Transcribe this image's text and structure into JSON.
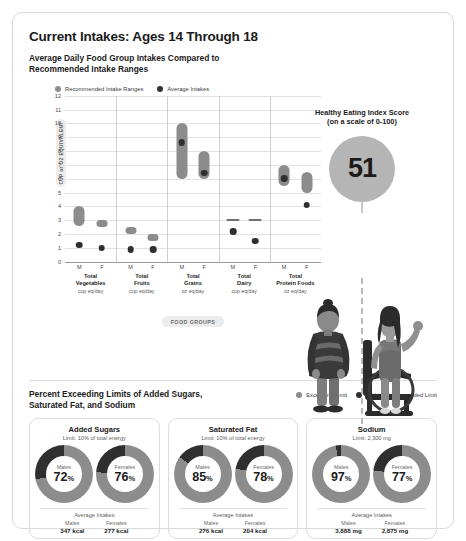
{
  "header": {
    "title": "Current Intakes: Ages 14 Through 18",
    "subtitle_line1": "Average Daily Food Group Intakes Compared to",
    "subtitle_line2": "Recommended Intake Ranges"
  },
  "legend": {
    "range_label": "Recommended Intake Ranges",
    "average_label": "Average Intakes",
    "range_color": "#8c8c8c",
    "average_color": "#333333"
  },
  "hei": {
    "title_line1": "Healthy Eating Index Score",
    "title_line2": "(on a scale of 0-100)",
    "score": "51",
    "circle_color": "#b5b5b5"
  },
  "food_groups_pill": "FOOD GROUPS",
  "chart_data": {
    "type": "bar",
    "title": "Average Daily Food Group Intakes Compared to Recommended Intake Ranges",
    "xlabel": "FOOD GROUPS",
    "ylabel": "CUP or OZ EQUIVALENT",
    "ylim": [
      0,
      12
    ],
    "yticks": [
      0,
      1,
      2,
      3,
      4,
      5,
      6,
      7,
      8,
      9,
      10,
      11,
      12
    ],
    "grid": true,
    "legend_position": "top-left",
    "series": [
      {
        "name": "Recommended Intake Ranges",
        "color": "#8c8c8c"
      },
      {
        "name": "Average Intakes",
        "color": "#333333"
      }
    ],
    "groups": [
      {
        "name": "Total\nVegetables",
        "name_line1": "Total",
        "name_line2": "Vegetables",
        "unit": "cup eq/day",
        "points": [
          {
            "sex": "M",
            "range": [
              2.6,
              4.0
            ],
            "average": 1.2
          },
          {
            "sex": "F",
            "range": [
              2.5,
              3.0
            ],
            "average": 1.0
          }
        ]
      },
      {
        "name": "Total\nFruits",
        "name_line1": "Total",
        "name_line2": "Fruits",
        "unit": "cup eq/day",
        "points": [
          {
            "sex": "M",
            "range": [
              2.0,
              2.5
            ],
            "average": 0.9
          },
          {
            "sex": "F",
            "range": [
              1.5,
              2.0
            ],
            "average": 0.9
          }
        ]
      },
      {
        "name": "Total\nGrains",
        "name_line1": "Total",
        "name_line2": "Grains",
        "unit": "oz eq/day",
        "points": [
          {
            "sex": "M",
            "range": [
              6.0,
              10.0
            ],
            "average": 8.6
          },
          {
            "sex": "F",
            "range": [
              6.0,
              8.0
            ],
            "average": 6.4
          }
        ]
      },
      {
        "name": "Total\nDairy",
        "name_line1": "Total",
        "name_line2": "Dairy",
        "unit": "cup eq/day",
        "points": [
          {
            "sex": "M",
            "range": [
              3.0,
              3.0
            ],
            "average": 2.2
          },
          {
            "sex": "F",
            "range": [
              3.0,
              3.0
            ],
            "average": 1.5
          }
        ]
      },
      {
        "name": "Total\nProtein Foods",
        "name_line1": "Total",
        "name_line2": "Protein Foods",
        "unit": "oz eq/day",
        "points": [
          {
            "sex": "M",
            "range": [
              5.5,
              7.0
            ],
            "average": 6.0
          },
          {
            "sex": "F",
            "range": [
              5.0,
              6.5
            ],
            "average": 4.1
          }
        ]
      }
    ]
  },
  "bottom": {
    "title_line1": "Percent Exceeding Limits of Added Sugars,",
    "title_line2": "Saturated Fat, and Sodium",
    "legend": {
      "exceeding_label": "Exceeding Limit",
      "within_label": "Within Recommended Limit",
      "exceeding_color": "#8c8c8c",
      "within_color": "#2f2f2f"
    },
    "average_intakes_label": "Average Intakes",
    "cards": [
      {
        "title": "Added Sugars",
        "limit": "Limit: 10% of total energy",
        "donuts": [
          {
            "sex": "Males",
            "percent": "72",
            "symbol": "%",
            "value": "347 kcal"
          },
          {
            "sex": "Females",
            "percent": "76",
            "symbol": "%",
            "value": "277 kcal"
          }
        ]
      },
      {
        "title": "Saturated Fat",
        "limit": "Limit: 10% of total energy",
        "donuts": [
          {
            "sex": "Males",
            "percent": "85",
            "symbol": "%",
            "value": "276 kcal"
          },
          {
            "sex": "Females",
            "percent": "78",
            "symbol": "%",
            "value": "204 kcal"
          }
        ]
      },
      {
        "title": "Sodium",
        "limit": "Limit: 2,300 mg",
        "donuts": [
          {
            "sex": "Males",
            "percent": "97",
            "symbol": "%",
            "value": "3,888 mg"
          },
          {
            "sex": "Females",
            "percent": "77",
            "symbol": "%",
            "value": "2,875 mg"
          }
        ]
      }
    ]
  }
}
